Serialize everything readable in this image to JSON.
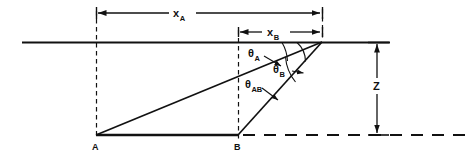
{
  "figure": {
    "type": "technical-geometry-diagram",
    "background_color": "#ffffff",
    "line_color": "#111111"
  },
  "labels": {
    "distance_a": {
      "symbol": "x",
      "subscript": "A"
    },
    "distance_b": {
      "symbol": "x",
      "subscript": "B"
    },
    "depth": {
      "symbol": "Z",
      "subscript": ""
    },
    "angle_a": {
      "symbol": "θ",
      "subscript": "A"
    },
    "angle_b": {
      "symbol": "θ",
      "subscript": "B"
    },
    "angle_ab": {
      "symbol": "θ",
      "subscript": "AB"
    },
    "point_a": {
      "symbol": "A"
    },
    "point_b": {
      "symbol": "B"
    }
  },
  "geometry": {
    "surface_line": {
      "x1": 22,
      "y1": 42,
      "x2": 390,
      "y2": 42
    },
    "apex": {
      "x": 322,
      "y": 42
    },
    "point_a": {
      "x": 96,
      "y": 135
    },
    "point_b": {
      "x": 238,
      "y": 135
    },
    "baseline_solid": {
      "x1": 96,
      "y1": 135,
      "x2": 238,
      "y2": 135
    },
    "baseline_dashed": {
      "x1": 238,
      "y1": 135,
      "x2": 466,
      "y2": 135
    },
    "dim_xa": {
      "x1": 96,
      "x2": 322,
      "y": 13
    },
    "dim_xb": {
      "x1": 238,
      "x2": 322,
      "y": 32
    },
    "dim_z": {
      "x": 377,
      "y1": 42,
      "y2": 135
    }
  }
}
